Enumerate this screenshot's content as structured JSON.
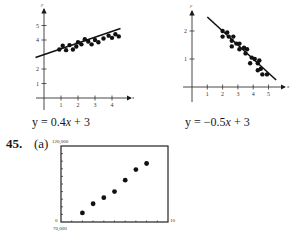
{
  "left_graph": {
    "equation_prefix": "y = 0.4",
    "equation_var": "x",
    "equation_suffix": " + 3",
    "x_label": "x",
    "y_label": "y",
    "x_ticks": [
      "1",
      "2",
      "3",
      "4"
    ],
    "y_ticks": [
      "1",
      "2",
      "4",
      "5"
    ]
  },
  "right_graph": {
    "equation_prefix": "y = −0.5",
    "equation_var": "x",
    "equation_suffix": " + 3",
    "x_label": "x",
    "y_label": "y",
    "x_ticks": [
      "1",
      "2",
      "3",
      "4",
      "5"
    ],
    "y_ticks": [
      "1",
      "2"
    ]
  },
  "problem": {
    "number": "45.",
    "part": "(a)",
    "y_max_label": "120,000",
    "y_min_label": "0",
    "x_max_label": "10",
    "x_min_label": "70,000"
  },
  "chart_data": [
    {
      "type": "scatter",
      "title": "y = 0.4x + 3",
      "xlabel": "x",
      "ylabel": "y",
      "xlim": [
        0,
        4.7
      ],
      "ylim": [
        0,
        5.5
      ],
      "x_ticks": [
        1,
        2,
        3,
        4
      ],
      "y_ticks": [
        1,
        2,
        4,
        5
      ],
      "points": [
        [
          0.9,
          3.35
        ],
        [
          1.1,
          3.6
        ],
        [
          1.3,
          3.3
        ],
        [
          1.5,
          3.65
        ],
        [
          1.7,
          3.35
        ],
        [
          1.9,
          3.55
        ],
        [
          2.0,
          3.85
        ],
        [
          2.2,
          3.7
        ],
        [
          2.4,
          4.05
        ],
        [
          2.6,
          3.9
        ],
        [
          2.8,
          3.7
        ],
        [
          3.0,
          4.0
        ],
        [
          3.2,
          3.85
        ],
        [
          3.5,
          4.1
        ],
        [
          3.8,
          4.3
        ],
        [
          4.0,
          4.15
        ],
        [
          4.2,
          4.4
        ],
        [
          4.4,
          4.25
        ]
      ],
      "line": {
        "slope": 0.4,
        "intercept": 3,
        "x_range": [
          -0.5,
          4.5
        ]
      }
    },
    {
      "type": "scatter",
      "title": "y = -0.5x + 3",
      "xlabel": "x",
      "ylabel": "y",
      "xlim": [
        0,
        5.8
      ],
      "ylim": [
        0,
        2.8
      ],
      "x_ticks": [
        1,
        2,
        3,
        4,
        5
      ],
      "y_ticks": [
        1,
        2
      ],
      "points": [
        [
          2.0,
          2.0
        ],
        [
          2.0,
          1.8
        ],
        [
          2.3,
          1.95
        ],
        [
          2.4,
          1.8
        ],
        [
          2.6,
          1.65
        ],
        [
          2.7,
          1.8
        ],
        [
          2.6,
          1.45
        ],
        [
          2.9,
          1.55
        ],
        [
          3.1,
          1.55
        ],
        [
          3.1,
          1.35
        ],
        [
          3.4,
          1.4
        ],
        [
          3.5,
          1.2
        ],
        [
          3.6,
          1.35
        ],
        [
          3.9,
          1.05
        ],
        [
          3.8,
          0.85
        ],
        [
          4.1,
          1.0
        ],
        [
          4.3,
          0.85
        ],
        [
          4.4,
          0.95
        ],
        [
          4.3,
          0.6
        ],
        [
          4.5,
          0.65
        ],
        [
          4.6,
          0.45
        ],
        [
          4.9,
          0.45
        ]
      ],
      "line": {
        "slope": -0.5,
        "intercept": 3,
        "x_range": [
          1,
          5.5
        ]
      }
    },
    {
      "type": "scatter",
      "title": "45. (a)",
      "xlabel": "",
      "ylabel": "",
      "xlim": [
        0,
        10
      ],
      "ylim": [
        70000,
        120000
      ],
      "x_range_labels": [
        "0",
        "10"
      ],
      "y_range_labels": [
        "70,000",
        "120,000"
      ],
      "points": [
        [
          2,
          76000
        ],
        [
          3,
          82000
        ],
        [
          4,
          86000
        ],
        [
          5,
          90000
        ],
        [
          6,
          97500
        ],
        [
          7,
          104500
        ],
        [
          8,
          108500
        ]
      ]
    }
  ]
}
